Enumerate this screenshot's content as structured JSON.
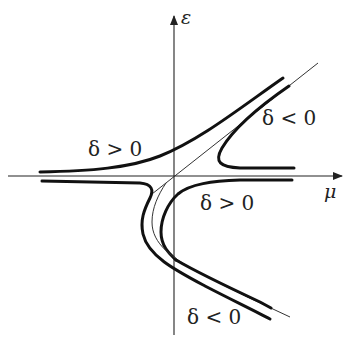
{
  "diagram": {
    "title": "",
    "axes": {
      "horizontal_label": "μ",
      "vertical_label": "ε"
    },
    "regions": [
      {
        "id": "upper-left",
        "label": "δ > 0"
      },
      {
        "id": "upper-right",
        "label": "δ < 0"
      },
      {
        "id": "lower-right-near-axis",
        "label": "δ > 0"
      },
      {
        "id": "lower-right-far",
        "label": "δ < 0"
      }
    ],
    "colors": {
      "ink": "#111111",
      "background": "#ffffff"
    }
  }
}
